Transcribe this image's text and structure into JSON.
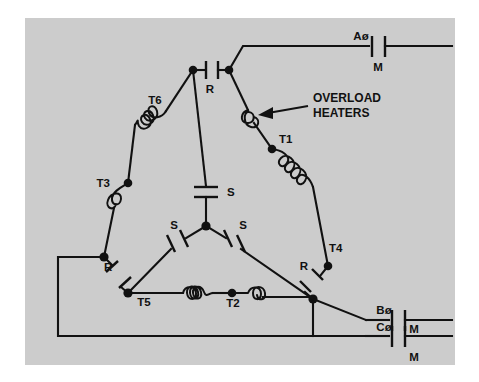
{
  "figure": {
    "panel_color": "#cccccc",
    "line_color": "#111111",
    "background_color": "#ffffff"
  },
  "annotation": {
    "line1": "OVERLOAD",
    "line2": "HEATERS",
    "arrow_name": "overload-heaters-callout"
  },
  "phases": [
    {
      "id": "a",
      "label": "Aø",
      "contact_label": "M",
      "contact_label_position": "below"
    },
    {
      "id": "b",
      "label": "Bø",
      "contact_label": "M",
      "contact_label_position": "right"
    },
    {
      "id": "c",
      "label": "Cø",
      "contact_label": "M",
      "contact_label_position": "below"
    }
  ],
  "terminals": [
    {
      "id": "t1",
      "label": "T1"
    },
    {
      "id": "t2",
      "label": "T2"
    },
    {
      "id": "t3",
      "label": "T3"
    },
    {
      "id": "t4",
      "label": "T4"
    },
    {
      "id": "t5",
      "label": "T5"
    },
    {
      "id": "t6",
      "label": "T6"
    }
  ],
  "contacts": {
    "run": [
      {
        "id": "r-top",
        "label": "R"
      },
      {
        "id": "r-bottom-left",
        "label": "R"
      },
      {
        "id": "r-bottom-right",
        "label": "R"
      }
    ],
    "start": [
      {
        "id": "s-center-vertical",
        "label": "S"
      },
      {
        "id": "s-left",
        "label": "S"
      },
      {
        "id": "s-right",
        "label": "S"
      }
    ],
    "main": [
      {
        "id": "m-phase-a",
        "label": "M"
      },
      {
        "id": "m-phase-b",
        "label": "M"
      },
      {
        "id": "m-phase-c",
        "label": "M"
      }
    ]
  }
}
